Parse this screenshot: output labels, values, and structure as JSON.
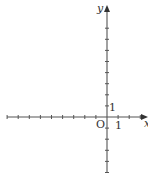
{
  "chart_data": {
    "type": "scatter",
    "title": "",
    "xlabel": "x",
    "ylabel": "y",
    "origin_label": "O",
    "x_unit_label": "1",
    "y_unit_label": "1",
    "xlim": [
      -9,
      3
    ],
    "ylim": [
      -5,
      9
    ],
    "x_ticks": [
      -9,
      -8,
      -7,
      -6,
      -5,
      -4,
      -3,
      -2,
      -1,
      1,
      2,
      3
    ],
    "y_ticks": [
      -5,
      -4,
      -3,
      -2,
      -1,
      1,
      2,
      3,
      4,
      5,
      6,
      7,
      8
    ],
    "grid": false,
    "series": [],
    "axis_color": "#555555"
  }
}
